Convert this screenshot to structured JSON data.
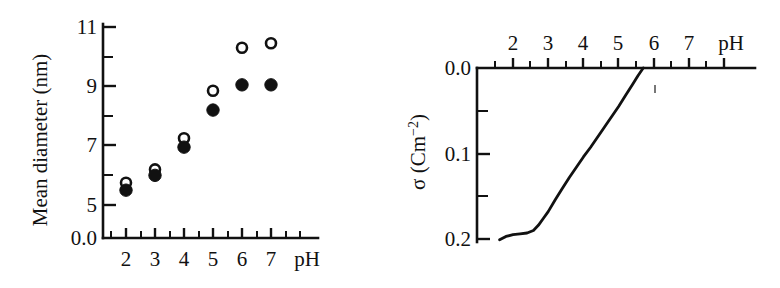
{
  "figure": {
    "background": "#ffffff",
    "ink": "#111111",
    "panel_count": 2
  },
  "chart_data": [
    {
      "type": "scatter",
      "panel": "left",
      "title": "",
      "xlabel": "pH",
      "ylabel": "Mean diameter (nm)",
      "xlim": [
        1.4,
        8.4
      ],
      "ylim": [
        4.0,
        11.6
      ],
      "grid": false,
      "legend_position": "none",
      "x_ticks": [
        2,
        3,
        4,
        5,
        6,
        7
      ],
      "x_tick_labels": [
        "2",
        "3",
        "4",
        "5",
        "6",
        "7"
      ],
      "x_minor_ticks": [
        1.5,
        2.5,
        3.5,
        4.5,
        5.5,
        6.5,
        7.5
      ],
      "y_ticks": [
        5,
        6,
        7,
        8,
        9,
        10,
        11
      ],
      "y_tick_labels": [
        "5",
        "",
        "7",
        "",
        "9",
        "",
        "11"
      ],
      "y_axis_origin_label": "0.0",
      "x": [
        2,
        3,
        4,
        5,
        6,
        7
      ],
      "series": [
        {
          "name": "open-circles",
          "marker": "open-circle",
          "values": [
            5.75,
            6.2,
            7.25,
            8.85,
            10.3,
            10.45
          ]
        },
        {
          "name": "filled-circles",
          "marker": "filled-circle",
          "values": [
            5.5,
            6.0,
            6.95,
            8.2,
            9.05,
            9.05
          ]
        }
      ]
    },
    {
      "type": "line",
      "panel": "right",
      "title": "",
      "xlabel": "pH",
      "ylabel_parts": {
        "symbol": "σ",
        "unit_open": " (Cm",
        "exponent": "−2",
        "unit_close": ")"
      },
      "ylabel": "σ (Cm−2)",
      "xlim": [
        1.5,
        8.5
      ],
      "ylim": [
        0.0,
        0.215
      ],
      "y_axis_inverted": true,
      "x_axis_position": "top",
      "grid": false,
      "legend_position": "none",
      "x_ticks": [
        2,
        3,
        4,
        5,
        6,
        7
      ],
      "x_tick_labels": [
        "2",
        "3",
        "4",
        "5",
        "6",
        "7"
      ],
      "x_minor_ticks": [
        1.5,
        2.5,
        3.5,
        4.5,
        5.5,
        6.5,
        7.5
      ],
      "y_ticks": [
        0.0,
        0.05,
        0.1,
        0.15,
        0.2
      ],
      "y_tick_labels": [
        "0.0",
        "",
        "0.1",
        "",
        "0.2"
      ],
      "x_values": [
        1.62,
        1.8,
        2.0,
        2.2,
        2.4,
        2.58,
        2.72,
        2.86,
        3.0,
        3.2,
        3.4,
        3.6,
        3.8,
        4.0,
        4.2,
        4.4,
        4.6,
        4.8,
        5.0,
        5.2,
        5.4,
        5.55,
        5.7
      ],
      "y_values": [
        0.201,
        0.197,
        0.195,
        0.194,
        0.193,
        0.19,
        0.184,
        0.176,
        0.168,
        0.154,
        0.141,
        0.128,
        0.116,
        0.104,
        0.093,
        0.081,
        0.069,
        0.057,
        0.045,
        0.032,
        0.019,
        0.009,
        0.0
      ]
    }
  ]
}
